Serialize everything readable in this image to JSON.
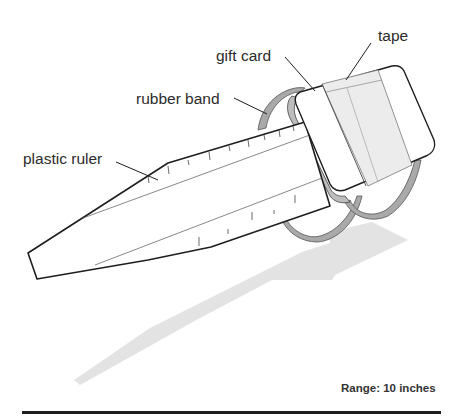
{
  "diagram": {
    "labels": {
      "tape": "tape",
      "gift_card": "gift card",
      "rubber_band": "rubber band",
      "plastic_ruler": "plastic ruler"
    },
    "caption": "Range: 10 inches",
    "colors": {
      "outline": "#1e1e1e",
      "ruler_fill": "#ffffff",
      "tape_fill": "#ececec",
      "band_fill": "#a9a9a9",
      "shadow": "#e3e3e3"
    }
  }
}
